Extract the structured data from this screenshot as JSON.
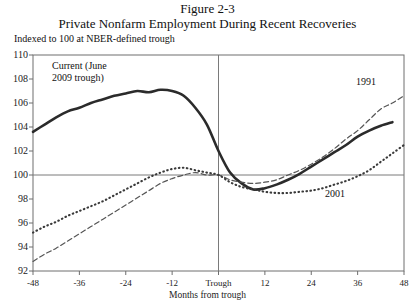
{
  "figure": {
    "number_label": "Figure 2-3",
    "title": "Private Nonfarm Employment During Recent Recoveries",
    "subtitle": "Indexed to 100 at NBER-defined trough"
  },
  "axes": {
    "y_ticks": [
      "110",
      "108",
      "106",
      "104",
      "102",
      "100",
      "98",
      "96",
      "94",
      "92"
    ],
    "x_ticks": [
      "-48",
      "-36",
      "-24",
      "-12",
      "Trough",
      "12",
      "24",
      "36",
      "48"
    ],
    "x_title": "Months from trough"
  },
  "annotations": {
    "current": "Current (June\n2009 trough)",
    "current_line1": "Current (June",
    "current_line2": "2009 trough)",
    "y1991": "1991",
    "y2001": "2001"
  },
  "colors": {
    "ink": "#2b2b2b",
    "grid": "#7a7a7a",
    "frame": "#6e6e6e",
    "background": "#ffffff"
  },
  "chart_data": {
    "type": "line",
    "title": "Private Nonfarm Employment During Recent Recoveries",
    "subtitle": "Indexed to 100 at NBER-defined trough",
    "xlabel": "Months from trough",
    "ylabel": "",
    "xlim": [
      -48,
      48
    ],
    "ylim": [
      92,
      110
    ],
    "ytick_values": [
      92,
      94,
      96,
      98,
      100,
      102,
      104,
      106,
      108,
      110
    ],
    "xtick_values": [
      -48,
      -36,
      -24,
      -12,
      0,
      12,
      24,
      36,
      48
    ],
    "xtick_labels": [
      "-48",
      "-36",
      "-24",
      "-12",
      "Trough",
      "12",
      "24",
      "36",
      "48"
    ],
    "grid": false,
    "reference_lines": [
      {
        "axis": "y",
        "value": 100
      },
      {
        "axis": "x",
        "value": 0
      }
    ],
    "legend": "inline-annotations",
    "x": [
      -48,
      -45,
      -42,
      -39,
      -36,
      -33,
      -30,
      -27,
      -24,
      -21,
      -18,
      -15,
      -12,
      -9,
      -6,
      -3,
      0,
      3,
      6,
      9,
      12,
      15,
      18,
      21,
      24,
      27,
      30,
      33,
      36,
      39,
      42,
      45,
      48
    ],
    "series": [
      {
        "name": "Current (June 2009 trough)",
        "style": "solid",
        "values": [
          103.6,
          104.2,
          104.8,
          105.3,
          105.6,
          106.0,
          106.3,
          106.6,
          106.8,
          107.0,
          106.9,
          107.1,
          107.0,
          106.6,
          105.6,
          104.2,
          102.0,
          100.2,
          99.3,
          98.8,
          98.9,
          99.2,
          99.6,
          100.1,
          100.7,
          101.3,
          101.9,
          102.5,
          103.2,
          103.7,
          104.1,
          104.4,
          null
        ]
      },
      {
        "name": "1991",
        "style": "dashed",
        "values": [
          92.8,
          93.4,
          93.9,
          94.5,
          95.1,
          95.7,
          96.3,
          96.9,
          97.5,
          98.1,
          98.7,
          99.3,
          99.7,
          100.0,
          100.2,
          100.0,
          100.0,
          99.6,
          99.4,
          99.3,
          99.4,
          99.6,
          100.0,
          100.4,
          100.9,
          101.5,
          102.2,
          103.0,
          103.7,
          104.6,
          105.5,
          106.0,
          106.6
        ]
      },
      {
        "name": "2001",
        "style": "dotted",
        "values": [
          95.2,
          95.7,
          96.1,
          96.6,
          97.0,
          97.4,
          97.8,
          98.3,
          98.8,
          99.3,
          99.8,
          100.2,
          100.5,
          100.6,
          100.4,
          100.2,
          100.0,
          99.4,
          99.0,
          98.8,
          98.6,
          98.5,
          98.5,
          98.6,
          98.7,
          98.9,
          99.2,
          99.5,
          99.9,
          100.4,
          101.1,
          101.8,
          102.5
        ]
      }
    ]
  }
}
